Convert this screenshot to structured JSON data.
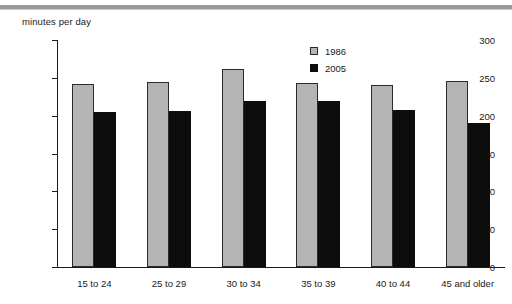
{
  "chart_data": {
    "type": "bar",
    "title": "",
    "xlabel": "",
    "ylabel": "minutes per day",
    "ylim": [
      0,
      300
    ],
    "ytick_step": 50,
    "yticks": [
      "0",
      "50",
      "100",
      "150",
      "200",
      "250",
      "300"
    ],
    "grid": false,
    "legend_position": "top-right",
    "categories": [
      "15 to 24",
      "25 to 29",
      "30 to 34",
      "35 to 39",
      "40 to 44",
      "45 and older"
    ],
    "series": [
      {
        "name": "1986",
        "color": "#b4b4b4",
        "values": [
          242,
          245,
          262,
          243,
          241,
          246
        ]
      },
      {
        "name": "2005",
        "color": "#0d0d0d",
        "values": [
          205,
          206,
          219,
          220,
          208,
          190
        ]
      }
    ]
  }
}
